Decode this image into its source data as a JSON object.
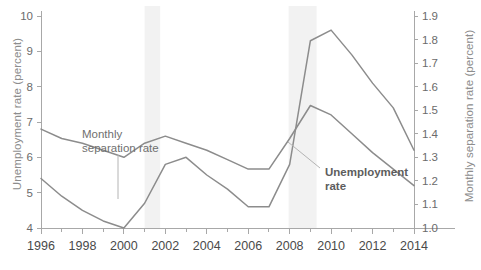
{
  "chart_data": {
    "type": "line",
    "title": "",
    "xlabel": "",
    "ylabel": "Unemployment rate (percent)",
    "ylabel_right": "Monthly separation rate (percent)",
    "x": [
      1996,
      1997,
      1998,
      1999,
      2000,
      2001,
      2002,
      2003,
      2004,
      2005,
      2006,
      2007,
      2008,
      2009,
      2010,
      2011,
      2012,
      2013,
      2014
    ],
    "xlim": [
      1996,
      2014
    ],
    "xticks": [
      1996,
      1998,
      2000,
      2002,
      2004,
      2006,
      2008,
      2010,
      2012,
      2014
    ],
    "xtick_labels": [
      "1996",
      "1998",
      "2000",
      "2002",
      "2004",
      "2006",
      "2008",
      "2010",
      "2012",
      "2014"
    ],
    "xminor_ticks": [
      1997,
      1999,
      2001,
      2003,
      2005,
      2007,
      2009,
      2011,
      2013
    ],
    "ylim": [
      4,
      10
    ],
    "yticks": [
      4,
      5,
      6,
      7,
      8,
      9,
      10
    ],
    "ytick_labels": [
      "4",
      "5",
      "6",
      "7",
      "8",
      "9",
      "10"
    ],
    "ylim_right": [
      1.0,
      1.9
    ],
    "yticks_right": [
      1.0,
      1.1,
      1.2,
      1.3,
      1.4,
      1.5,
      1.6,
      1.7,
      1.8,
      1.9
    ],
    "ytick_labels_right": [
      "1.0",
      "1.1",
      "1.2",
      "1.3",
      "1.4",
      "1.5",
      "1.6",
      "1.7",
      "1.8",
      "1.9"
    ],
    "grid": false,
    "legend": "annotations",
    "series": [
      {
        "name": "Unemployment rate",
        "axis": "left",
        "color": "#8c8c8c",
        "values": [
          5.4,
          4.9,
          4.5,
          4.2,
          4.0,
          4.7,
          5.8,
          6.0,
          5.5,
          5.1,
          4.6,
          4.6,
          5.8,
          9.3,
          9.6,
          8.9,
          8.1,
          7.4,
          6.2
        ]
      },
      {
        "name": "Monthly separation rate",
        "axis": "right",
        "color": "#8c8c8c",
        "values": [
          1.42,
          1.38,
          1.36,
          1.33,
          1.3,
          1.36,
          1.39,
          1.36,
          1.33,
          1.29,
          1.25,
          1.25,
          1.38,
          1.52,
          1.48,
          1.4,
          1.32,
          1.25,
          1.18
        ]
      }
    ],
    "shaded_regions": [
      {
        "name": "recession-2001",
        "x0": 2001.0,
        "x1": 2001.75,
        "color": "#f2f2f2"
      },
      {
        "name": "recession-2008",
        "x0": 2007.95,
        "x1": 2009.3,
        "color": "#f2f2f2"
      }
    ],
    "annotations": [
      {
        "name": "separation-rate-label",
        "line1": "Monthly",
        "line2": "separation rate",
        "bold": false
      },
      {
        "name": "unemployment-rate-label",
        "line1": "Unemployment",
        "line2": "rate",
        "bold": true
      }
    ]
  },
  "style": {
    "axis_color": "#a8a8a8",
    "tick_label_color": "#6b6b6b",
    "axis_title_color": "#8d8d8d",
    "background": "#ffffff"
  }
}
